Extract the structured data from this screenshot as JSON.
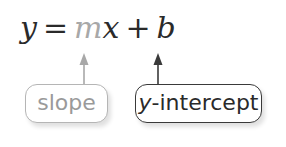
{
  "equation": {
    "lhs": "y",
    "equals": "=",
    "m": "m",
    "x": "x",
    "plus": "+",
    "b": "b"
  },
  "labels": {
    "slope": "slope",
    "y_intercept_var": "y",
    "y_intercept_rest": "-intercept"
  },
  "colors": {
    "slope": "#a8a8a8",
    "intercept": "#2a2a2a"
  }
}
